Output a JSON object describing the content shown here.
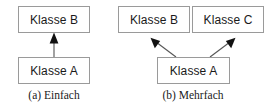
{
  "figure": {
    "background_color": "#ffffff",
    "box_border_color": "#9a9a9a",
    "box_fill_color": "#ffffff",
    "text_color": "#1a1a1a",
    "edge_color": "#555555",
    "arrowhead_color": "#111111"
  },
  "diagrams": [
    {
      "id": "einfach",
      "caption": "(a) Einfach",
      "boxes": [
        {
          "id": "a-super",
          "label": "Klasse B"
        },
        {
          "id": "a-sub",
          "label": "Klasse A"
        }
      ],
      "edges": [
        {
          "from": "Klasse A",
          "to": "Klasse B",
          "kind": "generalization-filled-arrow"
        }
      ]
    },
    {
      "id": "mehrfach",
      "caption": "(b) Mehrfach",
      "boxes": [
        {
          "id": "b-super-b",
          "label": "Klasse B"
        },
        {
          "id": "b-super-c",
          "label": "Klasse C"
        },
        {
          "id": "b-sub",
          "label": "Klasse A"
        }
      ],
      "edges": [
        {
          "from": "Klasse A",
          "to": "Klasse B",
          "kind": "generalization-filled-arrow"
        },
        {
          "from": "Klasse A",
          "to": "Klasse C",
          "kind": "generalization-filled-arrow"
        }
      ]
    }
  ]
}
